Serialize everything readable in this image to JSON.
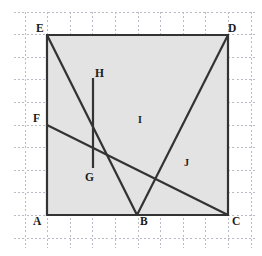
{
  "figure": {
    "canvas": {
      "width": 262,
      "height": 256,
      "background": "#ffffff"
    },
    "colors": {
      "grid_line": "#b9bcc6",
      "stroke": "#333333",
      "fill": "#e3e3e3",
      "label_text": "#1a1a1a"
    },
    "grid": {
      "visible": true,
      "style": "dashed",
      "spacing_px": 22.6,
      "origin_x": 25,
      "origin_y": 12,
      "columns": 11,
      "rows": 11
    },
    "square": {
      "name": "AECD",
      "fill": "#e3e3e3",
      "stroke_width": 2.2,
      "left": 47,
      "top": 35,
      "right": 228,
      "bottom": 215,
      "side_px": 180
    },
    "points": [
      {
        "id": "A",
        "label": "A",
        "x": 47,
        "y": 215,
        "label_x": 33,
        "label_y": 216,
        "role": "square-corner-bottom-left"
      },
      {
        "id": "B",
        "label": "B",
        "x": 137,
        "y": 215,
        "label_x": 140,
        "label_y": 216,
        "role": "bottom-edge-midpoint"
      },
      {
        "id": "C",
        "label": "C",
        "x": 228,
        "y": 215,
        "label_x": 232,
        "label_y": 216,
        "role": "square-corner-bottom-right"
      },
      {
        "id": "D",
        "label": "D",
        "x": 228,
        "y": 35,
        "label_x": 228,
        "label_y": 23,
        "role": "square-corner-top-right"
      },
      {
        "id": "E",
        "label": "E",
        "x": 47,
        "y": 35,
        "label_x": 36,
        "label_y": 23,
        "role": "square-corner-top-left"
      },
      {
        "id": "F",
        "label": "F",
        "x": 47,
        "y": 125,
        "label_x": 33,
        "label_y": 113,
        "role": "left-edge-midpoint"
      },
      {
        "id": "G",
        "label": "G",
        "x": 93,
        "y": 168,
        "label_x": 85,
        "label_y": 172,
        "role": "intersection-EB-FC"
      },
      {
        "id": "H",
        "label": "H",
        "x": 93,
        "y": 78,
        "label_x": 95,
        "label_y": 68,
        "role": "intersection-EB-vertical"
      },
      {
        "id": "I",
        "label": "I",
        "x": 137,
        "y": 125,
        "label_x": 138,
        "label_y": 115,
        "role": "center-intersection"
      },
      {
        "id": "J",
        "label": "J",
        "x": 182,
        "y": 168,
        "label_x": 184,
        "label_y": 158,
        "role": "intersection-FC-BD"
      }
    ],
    "segments": [
      {
        "id": "AE",
        "from": "A",
        "to": "E",
        "kind": "square-side",
        "label": "left side"
      },
      {
        "id": "ED",
        "from": "E",
        "to": "D",
        "kind": "square-side",
        "label": "top side"
      },
      {
        "id": "DC",
        "from": "D",
        "to": "C",
        "kind": "square-side",
        "label": "right side"
      },
      {
        "id": "AC",
        "from": "A",
        "to": "C",
        "kind": "square-side",
        "label": "bottom side"
      },
      {
        "id": "EB",
        "from": "E",
        "to": "B",
        "kind": "cut",
        "label": "diagonal E to B"
      },
      {
        "id": "FC",
        "from": "F",
        "to": "C",
        "kind": "cut",
        "label": "diagonal F to C"
      },
      {
        "id": "BD",
        "from": "B",
        "to": "D",
        "kind": "cut",
        "label": "diagonal B to D"
      },
      {
        "id": "HG",
        "from": "H",
        "to": "G",
        "kind": "cut",
        "label": "vertical H to G"
      }
    ]
  }
}
